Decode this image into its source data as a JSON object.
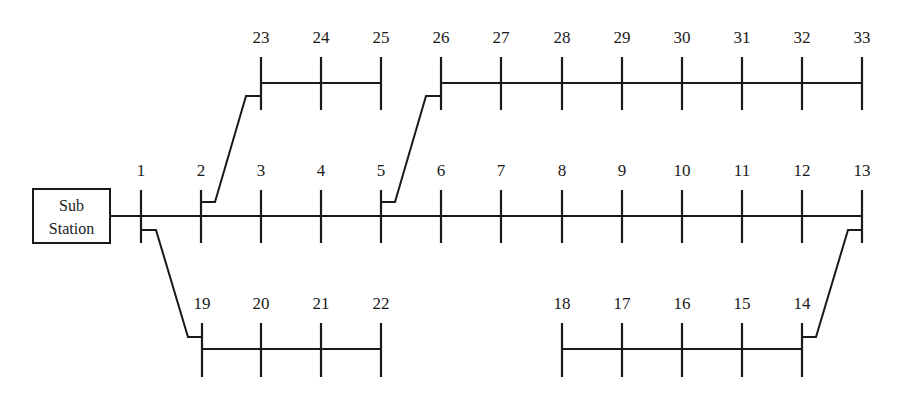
{
  "substation": {
    "label_line1": "Sub",
    "label_line2": "Station",
    "box": {
      "x": 33,
      "y": 189,
      "w": 77,
      "h": 54
    }
  },
  "colors": {
    "line": "#1a1a1a",
    "background": "#ffffff"
  },
  "feeders": [
    {
      "name": "main-feeder",
      "bar_y": 216,
      "tick_top": 190,
      "tick_bottom": 243,
      "label_y": 176,
      "start_x": 110,
      "buses": [
        {
          "id": "1",
          "x": 141
        },
        {
          "id": "2",
          "x": 201
        },
        {
          "id": "3",
          "x": 261
        },
        {
          "id": "4",
          "x": 321
        },
        {
          "id": "5",
          "x": 381
        },
        {
          "id": "6",
          "x": 441
        },
        {
          "id": "7",
          "x": 501
        },
        {
          "id": "8",
          "x": 562
        },
        {
          "id": "9",
          "x": 622
        },
        {
          "id": "10",
          "x": 682
        },
        {
          "id": "11",
          "x": 742
        },
        {
          "id": "12",
          "x": 802
        },
        {
          "id": "13",
          "x": 862
        }
      ]
    },
    {
      "name": "lateral-23-25",
      "bar_y": 83,
      "tick_top": 57,
      "tick_bottom": 110,
      "label_y": 43,
      "buses": [
        {
          "id": "23",
          "x": 261
        },
        {
          "id": "24",
          "x": 321
        },
        {
          "id": "25",
          "x": 381
        }
      ]
    },
    {
      "name": "lateral-26-33",
      "bar_y": 83,
      "tick_top": 57,
      "tick_bottom": 110,
      "label_y": 43,
      "buses": [
        {
          "id": "26",
          "x": 441
        },
        {
          "id": "27",
          "x": 501
        },
        {
          "id": "28",
          "x": 562
        },
        {
          "id": "29",
          "x": 622
        },
        {
          "id": "30",
          "x": 682
        },
        {
          "id": "31",
          "x": 742
        },
        {
          "id": "32",
          "x": 802
        },
        {
          "id": "33",
          "x": 862
        }
      ]
    },
    {
      "name": "lateral-19-22",
      "bar_y": 349,
      "tick_top": 323,
      "tick_bottom": 377,
      "label_y": 309,
      "buses": [
        {
          "id": "19",
          "x": 202
        },
        {
          "id": "20",
          "x": 261
        },
        {
          "id": "21",
          "x": 321
        },
        {
          "id": "22",
          "x": 381
        }
      ]
    },
    {
      "name": "lateral-14-18",
      "bar_y": 349,
      "tick_top": 323,
      "tick_bottom": 377,
      "label_y": 309,
      "buses": [
        {
          "id": "18",
          "x": 562
        },
        {
          "id": "17",
          "x": 622
        },
        {
          "id": "16",
          "x": 682
        },
        {
          "id": "15",
          "x": 742
        },
        {
          "id": "14",
          "x": 802
        }
      ]
    }
  ],
  "branch_connections": [
    {
      "from": "2",
      "to": "23",
      "points": [
        [
          201,
          202
        ],
        [
          215,
          202
        ],
        [
          246,
          96
        ],
        [
          261,
          96
        ]
      ]
    },
    {
      "from": "5",
      "to": "26",
      "points": [
        [
          381,
          202
        ],
        [
          395,
          202
        ],
        [
          426,
          96
        ],
        [
          441,
          96
        ]
      ]
    },
    {
      "from": "1",
      "to": "19",
      "points": [
        [
          141,
          230
        ],
        [
          156,
          230
        ],
        [
          188,
          337
        ],
        [
          202,
          337
        ]
      ]
    },
    {
      "from": "13",
      "to": "14",
      "points": [
        [
          862,
          230
        ],
        [
          848,
          230
        ],
        [
          816,
          337
        ],
        [
          802,
          337
        ]
      ]
    }
  ]
}
